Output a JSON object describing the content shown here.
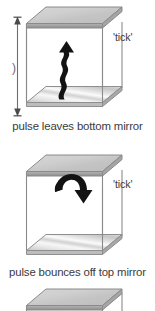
{
  "figure": {
    "title_visible": false,
    "background": "#ffffff",
    "ink_color": "#3b3b3b",
    "arrow_color": "#111111",
    "mirror_gray": "#c8c8c8"
  },
  "panels": [
    {
      "id": "panel-1",
      "caption": "pulse leaves bottom mirror",
      "tick_label": "'tick'",
      "dimension_label": ")",
      "arrow_kind": "wavy-arrow-up",
      "arrow_name": "light-pulse-up-arrow"
    },
    {
      "id": "panel-2",
      "caption": "pulse bounces off top mirror",
      "tick_label": "'tick'",
      "arrow_kind": "curved-arrow-bounce",
      "arrow_name": "light-pulse-bounce-arrow"
    },
    {
      "id": "panel-3",
      "caption": "",
      "tick_label": "",
      "arrow_kind": "none",
      "arrow_name": "none"
    }
  ]
}
